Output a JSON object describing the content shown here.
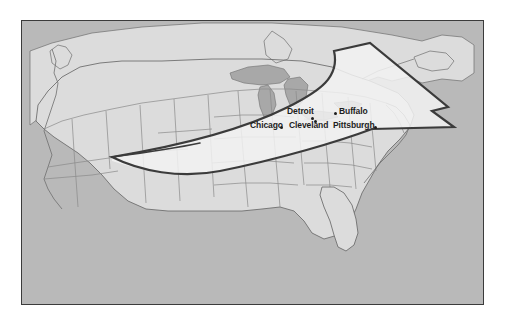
{
  "figure": {
    "kind": "map-illustration",
    "title_visible": false,
    "frame": {
      "border_color": "#3b3b3b"
    }
  },
  "map": {
    "region": "North America / Contiguous United States",
    "colors": {
      "ocean": "#b9b9b9",
      "land": "#dcdcdc",
      "land_highlight": "#ececec",
      "lake": "#a8a8a8",
      "border_line": "#8a8a8a",
      "coastline": "#6f6f6f",
      "arrow_stroke": "#3b3b3b",
      "arrow_fill": "#f2f2f2",
      "label_text": "#1d1d1d"
    }
  },
  "arrow": {
    "name": "migration-flow-arrow",
    "description": "Thick curved arrow sweeping from the southwest plains northeast through the Great Lakes to the Northeast",
    "direction": "southwest-to-northeast",
    "stroke_color": "#3b3b3b",
    "fill_color": "#f2f2f2",
    "stroke_width": 2
  },
  "cities": [
    {
      "name": "Chicago",
      "label": "Chicago",
      "label_x": 228,
      "label_y": 104,
      "dot_x": 258,
      "dot_y": 106,
      "dot_side": "right"
    },
    {
      "name": "Detroit",
      "label": "Detroit",
      "label_x": 265,
      "label_y": 90,
      "dot_x": 290,
      "dot_y": 97,
      "dot_side": "right"
    },
    {
      "name": "Cleveland",
      "label": "Cleveland",
      "label_x": 267,
      "label_y": 104,
      "dot_x": 292,
      "dot_y": 102,
      "dot_side": "right"
    },
    {
      "name": "Buffalo",
      "label": "Buffalo",
      "label_x": 317,
      "label_y": 90,
      "dot_x": 312,
      "dot_y": 92,
      "dot_side": "left"
    },
    {
      "name": "Pittsburgh",
      "label": "Pittsburgh",
      "label_x": 311,
      "label_y": 104,
      "dot_x": 352,
      "dot_y": 106,
      "dot_side": "right"
    }
  ]
}
